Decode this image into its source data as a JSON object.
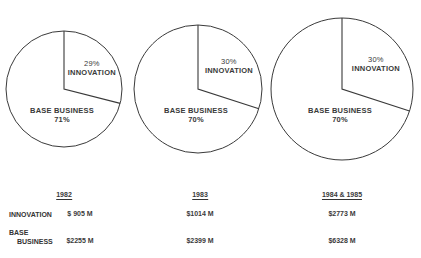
{
  "chart_data": [
    {
      "type": "pie",
      "title": "1982",
      "slices": [
        {
          "label": "INNOVATION",
          "value": 29,
          "pct_label": "29%"
        },
        {
          "label": "BASE BUSINESS",
          "value": 71,
          "pct_label": "71%"
        }
      ]
    },
    {
      "type": "pie",
      "title": "1983",
      "slices": [
        {
          "label": "INNOVATION",
          "value": 30,
          "pct_label": "30%"
        },
        {
          "label": "BASE BUSINESS",
          "value": 70,
          "pct_label": "70%"
        }
      ]
    },
    {
      "type": "pie",
      "title": "1984 & 1985",
      "slices": [
        {
          "label": "INNOVATION",
          "value": 30,
          "pct_label": "30%"
        },
        {
          "label": "BASE BUSINESS",
          "value": 70,
          "pct_label": "70%"
        }
      ]
    },
    {
      "type": "table",
      "columns": [
        "",
        "1982",
        "1983",
        "1984 & 1985"
      ],
      "rows": [
        [
          "INNOVATION",
          "$ 905 M",
          "$1014 M",
          "$2773 M"
        ],
        [
          "BASE BUSINESS",
          "$2255 M",
          "$2399 M",
          "$6328 M"
        ]
      ]
    }
  ],
  "pies": [
    {
      "cx": 64,
      "cy": 89,
      "r": 58,
      "innovation_pct": 29,
      "innov_label": "INNOVATION",
      "innov_pct_label": "29%",
      "base_label": "BASE BUSINESS",
      "base_pct_label": "71%"
    },
    {
      "cx": 198,
      "cy": 89,
      "r": 64,
      "innovation_pct": 30,
      "innov_label": "INNOVATION",
      "innov_pct_label": "30%",
      "base_label": "BASE BUSINESS",
      "base_pct_label": "70%"
    },
    {
      "cx": 342,
      "cy": 89,
      "r": 71,
      "innovation_pct": 30,
      "innov_label": "INNOVATION",
      "innov_pct_label": "30%",
      "base_label": "BASE BUSINESS",
      "base_pct_label": "70%"
    }
  ],
  "table": {
    "years": [
      "1982",
      "1983",
      "1984 & 1985"
    ],
    "row_innovation": {
      "label": "INNOVATION",
      "values": [
        "$ 905 M",
        "$1014 M",
        "$2773 M"
      ]
    },
    "row_base": {
      "label_line1": "BASE",
      "label_line2": "BUSINESS",
      "values": [
        "$2255 M",
        "$2399 M",
        "$6328 M"
      ]
    }
  },
  "colors": {
    "stroke": "#3a3a3a",
    "fill": "#ffffff"
  }
}
